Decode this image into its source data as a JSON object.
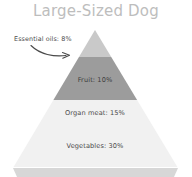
{
  "chart": {
    "title": "Large-Sized Dog"
  },
  "chart_data": {
    "type": "pie",
    "title": "Large-Sized Dog",
    "subtitle": "",
    "xlabel": "",
    "ylabel": "",
    "shape": "pyramid",
    "legend_position": "none",
    "grid": false,
    "categories": [
      "Essential oils",
      "Fruit",
      "Organ meat",
      "Vegetables"
    ],
    "values": [
      8,
      10,
      15,
      30
    ],
    "value_unit": "%",
    "labels": [
      "Essential oils: 8%",
      "Fruit: 10%",
      "Organ meat: 15%",
      "Vegetables: 30%"
    ],
    "segments": [
      {
        "name": "Essential oils",
        "label": "Essential oils: 8%",
        "value": 8,
        "color": "#c9c9c9",
        "label_placement": "callout-left",
        "label_x": 14,
        "label_y": 39,
        "band_top": 30,
        "band_bottom": 57
      },
      {
        "name": "Fruit",
        "label": "Fruit: 10%",
        "value": 10,
        "color": "#9c9c9c",
        "label_placement": "inside",
        "label_x": 95,
        "label_y": 80,
        "band_top": 57,
        "band_bottom": 100
      },
      {
        "name": "Organ meat",
        "label": "Organ meat: 15%",
        "value": 15,
        "color": "#f1f1f1",
        "label_placement": "inside",
        "label_x": 95,
        "label_y": 113,
        "band_top": 100,
        "band_bottom": 135
      },
      {
        "name": "Vegetables",
        "label": "Vegetables: 30%",
        "value": 30,
        "color": "#f1f1f1",
        "label_placement": "inside",
        "label_x": 95,
        "label_y": 146,
        "band_top": 135,
        "band_bottom": 167
      }
    ],
    "base_bar": {
      "name": "base-shadow",
      "color": "#d7d7d7",
      "top": 168,
      "bottom": 177
    },
    "annotations": [
      {
        "name": "essential-oils-callout-arrow",
        "type": "curved-arrow",
        "from": [
          30,
          46
        ],
        "to": [
          69,
          55
        ],
        "color": "#4a4a4a"
      }
    ],
    "colors": {
      "background": "#ffffff",
      "title": "#bdbdbd",
      "label_text": "#4a4a4a",
      "band_1": "#c9c9c9",
      "band_2": "#9c9c9c",
      "band_3": "#f1f1f1",
      "band_4": "#f1f1f1",
      "base_bar": "#d7d7d7"
    },
    "geometry": {
      "apex": [
        95,
        30
      ],
      "base_left": 13,
      "base_right": 178,
      "base_y": 168
    }
  }
}
